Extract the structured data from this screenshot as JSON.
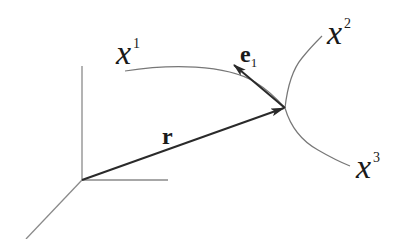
{
  "diagram": {
    "labels": {
      "x1": {
        "base": "x",
        "sup": "1"
      },
      "x2": {
        "base": "x",
        "sup": "2"
      },
      "x3": {
        "base": "x",
        "sup": "3"
      },
      "r": "r",
      "e1": {
        "base": "e",
        "sub": "1"
      }
    },
    "colors": {
      "axis": "#8a8a8a",
      "curve": "#777777",
      "vector": "#2a2a2a",
      "text": "#1a1a1a"
    },
    "points": {
      "origin": [
        82,
        180
      ],
      "intersection": [
        285,
        108
      ]
    }
  }
}
